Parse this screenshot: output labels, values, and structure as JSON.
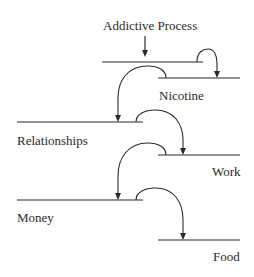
{
  "diagram": {
    "title": "Addictive Process",
    "levels": [
      {
        "id": "process-level",
        "label": ""
      },
      {
        "id": "nicotine",
        "label": "Nicotine"
      },
      {
        "id": "relationships",
        "label": "Relationships"
      },
      {
        "id": "work",
        "label": "Work"
      },
      {
        "id": "money",
        "label": "Money"
      },
      {
        "id": "food",
        "label": "Food"
      }
    ],
    "flow": [
      {
        "from": "Addictive Process",
        "to": "process-level"
      },
      {
        "from": "process-level",
        "to": "Nicotine"
      },
      {
        "from": "Nicotine",
        "to": "Relationships"
      },
      {
        "from": "Relationships",
        "to": "Work"
      },
      {
        "from": "Work",
        "to": "Money"
      },
      {
        "from": "Money",
        "to": "Food"
      }
    ],
    "colors": {
      "ink": "#2a2a2a",
      "background": "#ffffff"
    }
  }
}
